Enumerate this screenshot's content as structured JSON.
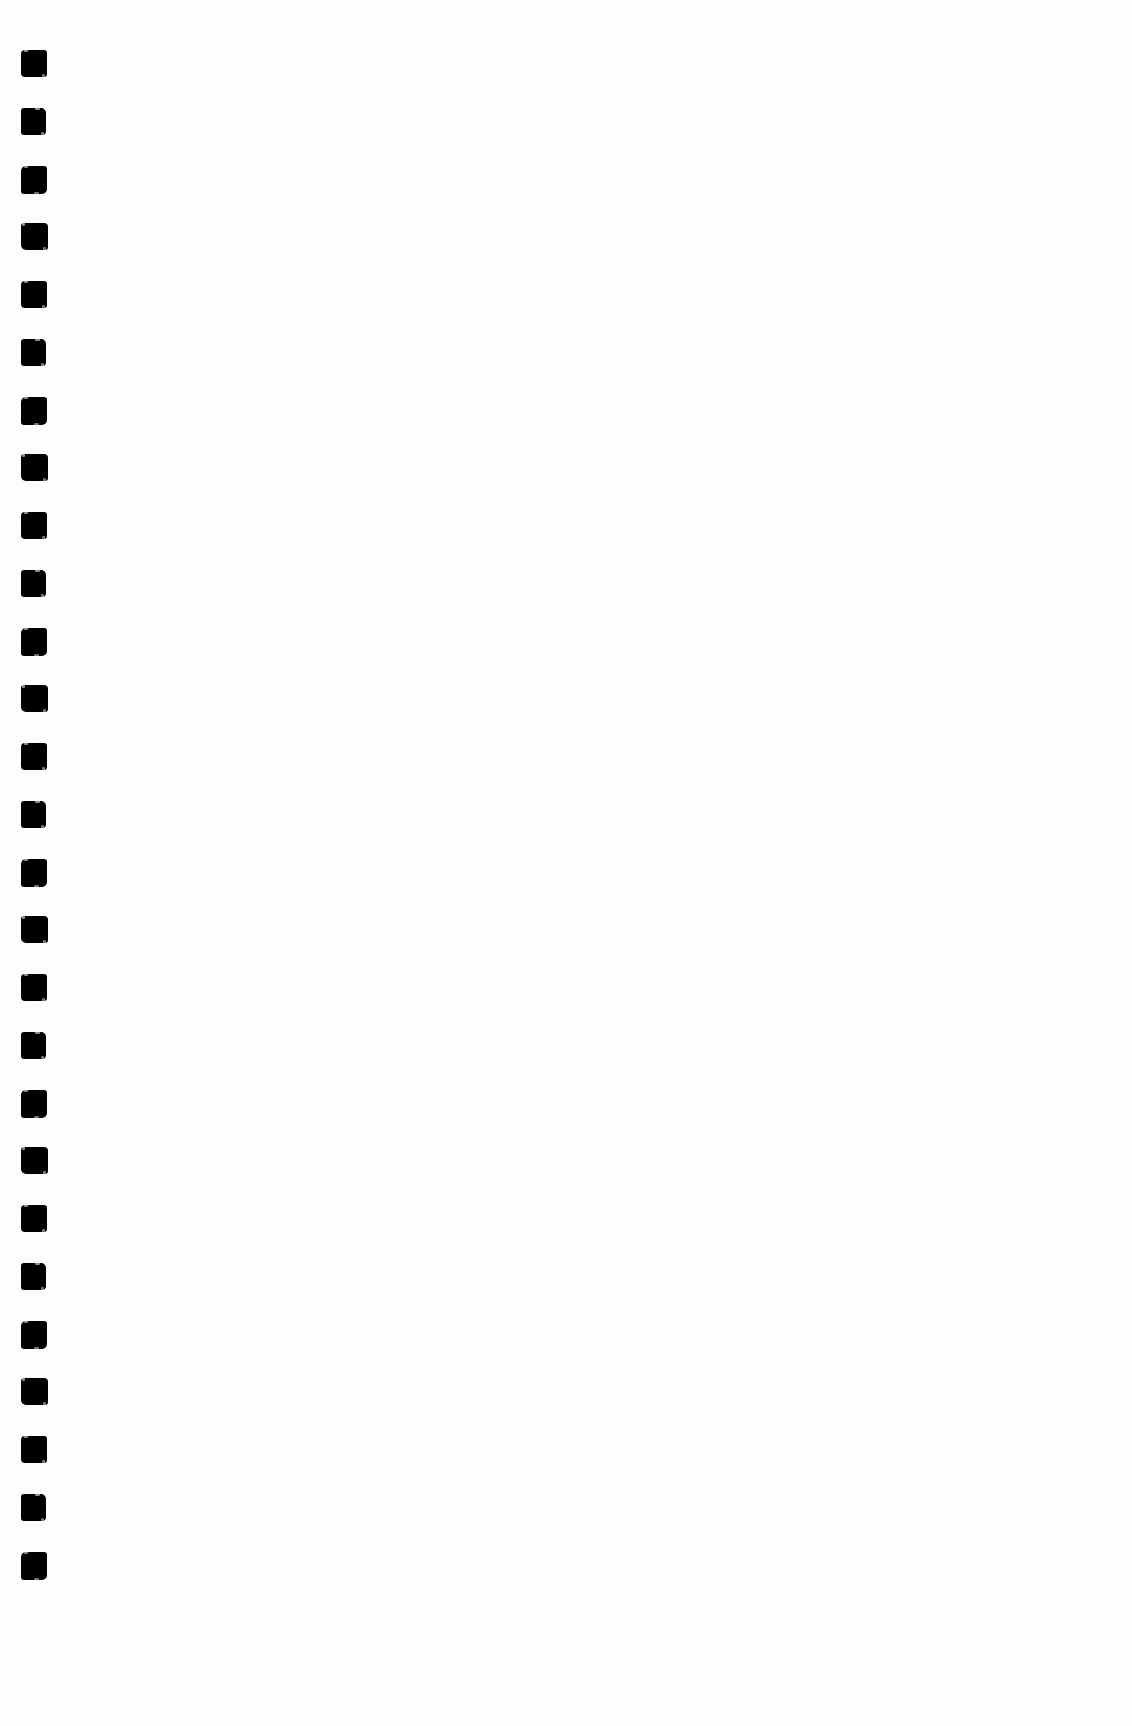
{
  "page": {
    "label": "scanned blank document page",
    "width": 1132,
    "height": 1726,
    "background_color": "#fdfdfd",
    "body_text": ""
  },
  "registration_column": {
    "label": "registration mark column",
    "icon_name": "black-square-mark",
    "ink_color": "#000000",
    "mark_count": 27,
    "mark_width": 26,
    "mark_height": 27,
    "left_offset": 21,
    "first_mark_top": 50,
    "pitch": 57.8,
    "marks": [
      {
        "index": 1,
        "top": 50
      },
      {
        "index": 2,
        "top": 108
      },
      {
        "index": 3,
        "top": 166
      },
      {
        "index": 4,
        "top": 223
      },
      {
        "index": 5,
        "top": 281
      },
      {
        "index": 6,
        "top": 339
      },
      {
        "index": 7,
        "top": 397
      },
      {
        "index": 8,
        "top": 454
      },
      {
        "index": 9,
        "top": 512
      },
      {
        "index": 10,
        "top": 570
      },
      {
        "index": 11,
        "top": 628
      },
      {
        "index": 12,
        "top": 685
      },
      {
        "index": 13,
        "top": 743
      },
      {
        "index": 14,
        "top": 801
      },
      {
        "index": 15,
        "top": 859
      },
      {
        "index": 16,
        "top": 916
      },
      {
        "index": 17,
        "top": 974
      },
      {
        "index": 18,
        "top": 1032
      },
      {
        "index": 19,
        "top": 1090
      },
      {
        "index": 20,
        "top": 1147
      },
      {
        "index": 21,
        "top": 1205
      },
      {
        "index": 22,
        "top": 1263
      },
      {
        "index": 23,
        "top": 1321
      },
      {
        "index": 24,
        "top": 1378
      },
      {
        "index": 25,
        "top": 1436
      },
      {
        "index": 26,
        "top": 1494
      },
      {
        "index": 27,
        "top": 1552
      }
    ]
  },
  "content": {
    "label": "document body",
    "text": "",
    "note": ""
  }
}
